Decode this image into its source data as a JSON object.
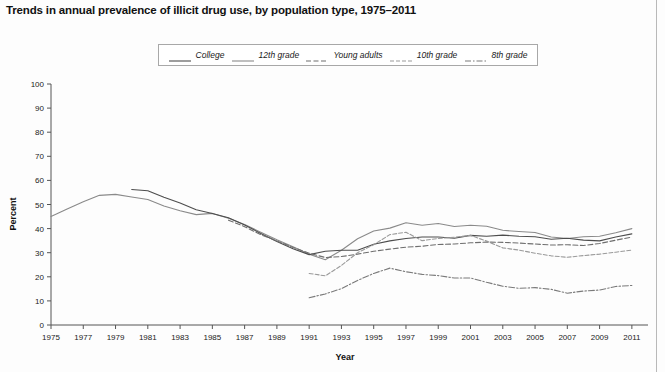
{
  "title": "Trends in annual prevalence of illicit drug use, by population type, 1975–2011",
  "axis": {
    "xlabel": "Year",
    "ylabel": "Percent"
  },
  "legend": {
    "position": "top-center",
    "items": [
      {
        "label": "College",
        "style": "solid",
        "color": "#4d4d4d"
      },
      {
        "label": "12th grade",
        "style": "solid",
        "color": "#8a8a8a"
      },
      {
        "label": "Young adults",
        "style": "dashed",
        "color": "#6e6e6e"
      },
      {
        "label": "10th grade",
        "style": "dashed-fine",
        "color": "#9a9a9a"
      },
      {
        "label": "8th grade",
        "style": "dash-dot",
        "color": "#7a7a7a"
      }
    ]
  },
  "chart_data": {
    "type": "line",
    "title": "Trends in annual prevalence of illicit drug use, by population type, 1975–2011",
    "xlabel": "Year",
    "ylabel": "Percent",
    "xlim": [
      1975,
      2012
    ],
    "ylim": [
      0,
      100
    ],
    "ytick_step": 10,
    "yticks": [
      0,
      10,
      20,
      30,
      40,
      50,
      60,
      70,
      80,
      90,
      100
    ],
    "xticks": [
      1975,
      1977,
      1979,
      1981,
      1983,
      1985,
      1987,
      1989,
      1991,
      1993,
      1995,
      1997,
      1999,
      2001,
      2003,
      2005,
      2007,
      2009,
      2011
    ],
    "grid": false,
    "legend_position": "top-center",
    "series": [
      {
        "name": "12th grade",
        "style": "solid",
        "color": "#8a8a8a",
        "x": [
          1975,
          1976,
          1977,
          1978,
          1979,
          1980,
          1981,
          1982,
          1983,
          1984,
          1985,
          1986,
          1987,
          1988,
          1989,
          1990,
          1991,
          1992,
          1993,
          1994,
          1995,
          1996,
          1997,
          1998,
          1999,
          2000,
          2001,
          2002,
          2003,
          2004,
          2005,
          2006,
          2007,
          2008,
          2009,
          2010,
          2011
        ],
        "y": [
          45.0,
          48.1,
          51.1,
          53.8,
          54.2,
          53.1,
          52.1,
          49.4,
          47.4,
          45.8,
          46.3,
          44.3,
          41.7,
          38.5,
          35.4,
          32.5,
          29.4,
          27.1,
          31.0,
          35.8,
          39.0,
          40.2,
          42.4,
          41.4,
          42.1,
          40.9,
          41.4,
          41.0,
          39.3,
          38.8,
          38.4,
          36.5,
          35.9,
          36.6,
          36.8,
          38.3,
          40.0
        ]
      },
      {
        "name": "College",
        "style": "solid",
        "color": "#4d4d4d",
        "x": [
          1980,
          1981,
          1982,
          1983,
          1984,
          1985,
          1986,
          1987,
          1988,
          1989,
          1990,
          1991,
          1992,
          1993,
          1994,
          1995,
          1996,
          1997,
          1998,
          1999,
          2000,
          2001,
          2002,
          2003,
          2004,
          2005,
          2006,
          2007,
          2008,
          2009,
          2010,
          2011
        ],
        "y": [
          56.2,
          55.7,
          53.0,
          50.6,
          47.8,
          46.3,
          44.5,
          41.5,
          38.0,
          34.6,
          31.6,
          29.2,
          30.6,
          31.0,
          31.0,
          33.5,
          34.9,
          35.9,
          36.5,
          36.5,
          36.0,
          37.2,
          36.8,
          37.3,
          36.8,
          36.6,
          35.6,
          36.0,
          35.2,
          34.9,
          36.5,
          37.8
        ]
      },
      {
        "name": "Young adults",
        "style": "dashed",
        "color": "#6e6e6e",
        "x": [
          1986,
          1987,
          1988,
          1989,
          1990,
          1991,
          1992,
          1993,
          1994,
          1995,
          1996,
          1997,
          1998,
          1999,
          2000,
          2001,
          2002,
          2003,
          2004,
          2005,
          2006,
          2007,
          2008,
          2009,
          2010,
          2011
        ],
        "y": [
          43.5,
          40.8,
          37.5,
          34.9,
          32.2,
          29.8,
          28.0,
          28.4,
          29.4,
          30.6,
          31.5,
          32.3,
          32.7,
          33.4,
          33.6,
          34.1,
          34.4,
          34.3,
          34.0,
          33.6,
          33.2,
          33.3,
          33.0,
          33.8,
          35.2,
          36.5
        ]
      },
      {
        "name": "10th grade",
        "style": "dashed-fine",
        "color": "#9a9a9a",
        "x": [
          1991,
          1992,
          1993,
          1994,
          1995,
          1996,
          1997,
          1998,
          1999,
          2000,
          2001,
          2002,
          2003,
          2004,
          2005,
          2006,
          2007,
          2008,
          2009,
          2010,
          2011
        ],
        "y": [
          21.4,
          20.4,
          24.7,
          30.0,
          33.3,
          37.5,
          38.5,
          35.0,
          35.9,
          36.4,
          37.2,
          34.8,
          32.0,
          31.1,
          29.8,
          28.7,
          28.1,
          28.8,
          29.4,
          30.2,
          31.1
        ]
      },
      {
        "name": "8th grade",
        "style": "dash-dot",
        "color": "#7a7a7a",
        "x": [
          1991,
          1992,
          1993,
          1994,
          1995,
          1996,
          1997,
          1998,
          1999,
          2000,
          2001,
          2002,
          2003,
          2004,
          2005,
          2006,
          2007,
          2008,
          2009,
          2010,
          2011
        ],
        "y": [
          11.3,
          12.9,
          15.1,
          18.5,
          21.4,
          23.6,
          22.1,
          21.0,
          20.5,
          19.5,
          19.5,
          17.7,
          16.1,
          15.2,
          15.5,
          14.8,
          13.2,
          14.1,
          14.5,
          16.0,
          16.4
        ]
      }
    ]
  }
}
